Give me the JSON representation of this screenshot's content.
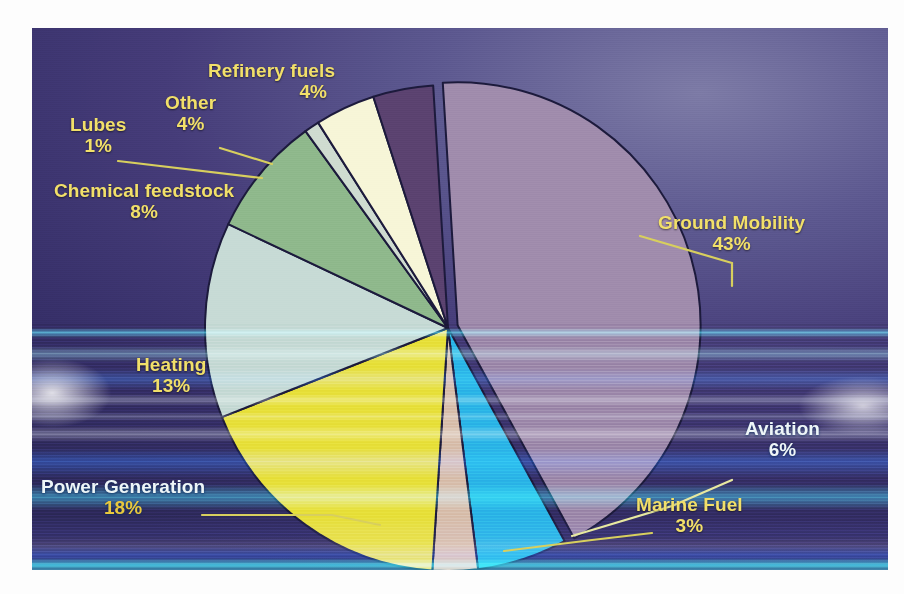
{
  "chart_data": {
    "type": "pie",
    "title": "",
    "legend_position": "none",
    "grid": false,
    "unit": "%",
    "categories": [
      "Ground Mobility",
      "Aviation",
      "Marine Fuel",
      "Power Generation",
      "Heating",
      "Chemical feedstock",
      "Lubes",
      "Other",
      "Refinery fuels"
    ],
    "values": [
      43,
      6,
      3,
      18,
      13,
      8,
      1,
      4,
      4
    ],
    "slices": [
      {
        "name": "Ground Mobility",
        "label": "Ground Mobility",
        "percent": 43,
        "percent_text": "43%",
        "color": "#a08cad",
        "exploded": true,
        "label_color": "#f2e06a"
      },
      {
        "name": "Aviation",
        "label": "Aviation",
        "percent": 6,
        "percent_text": "6%",
        "color": "#2bb7e8",
        "exploded": false,
        "label_color": "#eef6f8"
      },
      {
        "name": "Marine Fuel",
        "label": "Marine Fuel",
        "percent": 3,
        "percent_text": "3%",
        "color": "#d9c0ae",
        "exploded": false,
        "label_color": "#f2e06a"
      },
      {
        "name": "Power Generation",
        "label": "Power Generation",
        "percent": 18,
        "percent_text": "18%",
        "color": "#e8e13a",
        "exploded": false,
        "label_color": "#eef6f8"
      },
      {
        "name": "Heating",
        "label": "Heating",
        "percent": 13,
        "percent_text": "13%",
        "color": "#c7dbd6",
        "exploded": false,
        "label_color": "#f2e06a"
      },
      {
        "name": "Chemical feedstock",
        "label": "Chemical feedstock",
        "percent": 8,
        "percent_text": "8%",
        "color": "#8fb98c",
        "exploded": false,
        "label_color": "#f2e06a"
      },
      {
        "name": "Lubes",
        "label": "Lubes",
        "percent": 1,
        "percent_text": "1%",
        "color": "#cfdcd0",
        "exploded": false,
        "label_color": "#f2e06a"
      },
      {
        "name": "Other",
        "label": "Other",
        "percent": 4,
        "percent_text": "4%",
        "color": "#f7f6d8",
        "exploded": false,
        "label_color": "#f2e06a"
      },
      {
        "name": "Refinery fuels",
        "label": "Refinery fuels",
        "percent": 4,
        "percent_text": "4%",
        "color": "#5b4270",
        "exploded": false,
        "label_color": "#f2e06a"
      }
    ],
    "background_color": "#3b3270",
    "slice_outline_color": "#1c1a3c",
    "leader_line_color": "#d8cf5e"
  },
  "labels": {
    "ground_mobility": {
      "title": "Ground Mobility",
      "pct": "43%"
    },
    "aviation": {
      "title": "Aviation",
      "pct": "6%"
    },
    "marine_fuel": {
      "title": "Marine Fuel",
      "pct": "3%"
    },
    "power_generation": {
      "title": "Power Generation",
      "pct": "18%"
    },
    "heating": {
      "title": "Heating",
      "pct": "13%"
    },
    "chemical_feedstock": {
      "title": "Chemical feedstock",
      "pct": "8%"
    },
    "lubes": {
      "title": "Lubes",
      "pct": "1%"
    },
    "other": {
      "title": "Other",
      "pct": "4%"
    },
    "refinery_fuels": {
      "title": "Refinery fuels",
      "pct": "4%"
    }
  }
}
